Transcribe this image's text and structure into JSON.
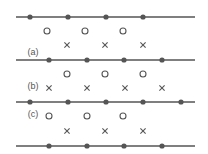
{
  "diagram": {
    "title": "",
    "colors": {
      "line": "#555555",
      "dot": "#555555",
      "circle": "#555555",
      "cross": "#555555"
    },
    "line_x_start": 16,
    "line_x_end": 195,
    "lines": [
      {
        "id": "line-1",
        "y": 17,
        "dots": [
          30,
          68,
          106,
          143
        ]
      },
      {
        "id": "line-2",
        "y": 60,
        "dots": [
          49,
          87,
          124,
          162
        ]
      },
      {
        "id": "line-3",
        "y": 102,
        "dots": [
          30,
          68,
          106,
          143,
          181
        ]
      },
      {
        "id": "line-4",
        "y": 146,
        "dots": [
          49,
          87,
          124,
          162
        ]
      }
    ],
    "panels": [
      {
        "label": "(a)",
        "label_pos": [
          33,
          55
        ],
        "circles": {
          "y": 31,
          "x": [
            47,
            85,
            123
          ]
        },
        "crosses": {
          "y": 45,
          "x": [
            67,
            105,
            143
          ]
        }
      },
      {
        "label": "(b)",
        "label_pos": [
          33,
          89
        ],
        "circles": {
          "y": 74,
          "x": [
            67,
            105,
            143
          ]
        },
        "crosses": {
          "y": 88,
          "x": [
            49,
            87,
            125,
            162
          ]
        }
      },
      {
        "label": "(c)",
        "label_pos": [
          33,
          117
        ],
        "circles": {
          "y": 116,
          "x": [
            49,
            87,
            123
          ]
        },
        "crosses": {
          "y": 131,
          "x": [
            67,
            105,
            143
          ]
        }
      }
    ]
  }
}
